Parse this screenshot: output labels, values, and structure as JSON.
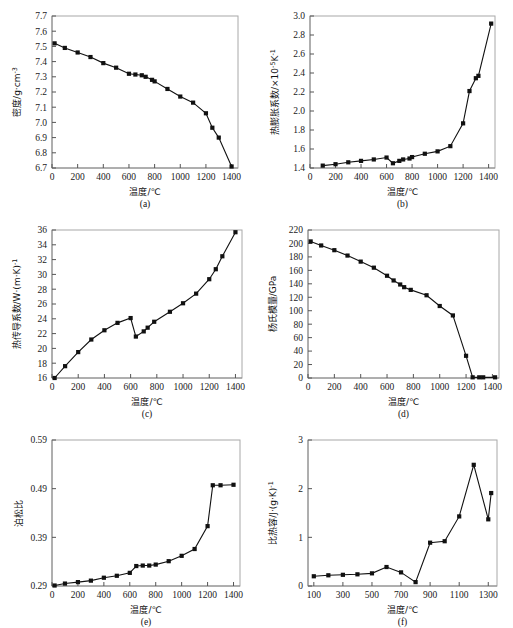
{
  "figure": {
    "xlabel": "温度/℃",
    "panels": [
      "(a)",
      "(b)",
      "(c)",
      "(d)",
      "(e)",
      "(f)"
    ]
  },
  "chart_data": [
    {
      "type": "line",
      "panel": "(a)",
      "title": "",
      "xlabel": "温度/℃",
      "ylabel": "密度/g·cm⁻³",
      "ylabel_base": "密度/g·cm",
      "ylabel_sup": "-3",
      "xlim": [
        0,
        1450
      ],
      "ylim": [
        6.7,
        7.7
      ],
      "xticks": [
        0,
        200,
        400,
        600,
        800,
        1000,
        1200,
        1400
      ],
      "yticks": [
        6.7,
        6.8,
        6.9,
        7.0,
        7.1,
        7.2,
        7.3,
        7.4,
        7.5,
        7.6,
        7.7
      ],
      "grid": false,
      "legend": "none",
      "x": [
        20,
        100,
        200,
        300,
        400,
        500,
        600,
        650,
        700,
        730,
        780,
        800,
        900,
        1000,
        1100,
        1200,
        1250,
        1300,
        1400
      ],
      "y": [
        7.52,
        7.49,
        7.46,
        7.43,
        7.39,
        7.36,
        7.32,
        7.315,
        7.31,
        7.3,
        7.28,
        7.27,
        7.22,
        7.17,
        7.13,
        7.06,
        6.965,
        6.9,
        6.71
      ]
    },
    {
      "type": "line",
      "panel": "(b)",
      "title": "",
      "xlabel": "温度/℃",
      "ylabel": "热膨胀系数/×10⁻⁵K⁻¹",
      "ylabel_base": "热膨胀系数/×10",
      "ylabel_sup": "-5",
      "ylabel_tail": "K",
      "xlim": [
        0,
        1450
      ],
      "ylim": [
        1.4,
        3.0
      ],
      "xticks": [
        0,
        200,
        400,
        600,
        800,
        1000,
        1200,
        1400
      ],
      "yticks": [
        1.4,
        1.6,
        1.8,
        2.0,
        2.2,
        2.4,
        2.6,
        2.8,
        3.0
      ],
      "grid": false,
      "legend": "none",
      "x": [
        100,
        200,
        300,
        400,
        500,
        600,
        650,
        700,
        730,
        780,
        800,
        900,
        1000,
        1100,
        1200,
        1250,
        1300,
        1320,
        1420
      ],
      "y": [
        1.425,
        1.44,
        1.46,
        1.475,
        1.49,
        1.51,
        1.45,
        1.475,
        1.49,
        1.5,
        1.515,
        1.55,
        1.575,
        1.63,
        1.87,
        2.21,
        2.345,
        2.37,
        2.92
      ]
    },
    {
      "type": "line",
      "panel": "(c)",
      "title": "",
      "xlabel": "温度/℃",
      "ylabel": "热传导系数/W·(m·K)⁻¹",
      "ylabel_base": "热传导系数/W·(m·K)",
      "ylabel_sup": "-1",
      "xlim": [
        0,
        1450
      ],
      "ylim": [
        16,
        36
      ],
      "xticks": [
        0,
        200,
        400,
        600,
        800,
        1000,
        1200,
        1400
      ],
      "yticks": [
        16,
        18,
        20,
        22,
        24,
        26,
        28,
        30,
        32,
        34,
        36
      ],
      "grid": false,
      "legend": "none",
      "x": [
        20,
        100,
        200,
        300,
        400,
        500,
        600,
        640,
        700,
        730,
        780,
        900,
        1000,
        1100,
        1200,
        1250,
        1300,
        1400
      ],
      "y": [
        16.0,
        17.6,
        19.5,
        21.2,
        22.45,
        23.45,
        24.1,
        21.6,
        22.3,
        22.8,
        23.6,
        24.95,
        26.1,
        27.4,
        29.35,
        30.7,
        32.45,
        35.7
      ]
    },
    {
      "type": "line",
      "panel": "(d)",
      "title": "",
      "xlabel": "温度/℃",
      "ylabel": "杨氏模量/GPa",
      "ylabel_base": "杨氏模量/GPa",
      "xlim": [
        0,
        1450
      ],
      "ylim": [
        0,
        220
      ],
      "xticks": [
        0,
        200,
        400,
        600,
        800,
        1000,
        1200,
        1400
      ],
      "yticks": [
        0,
        20,
        40,
        60,
        80,
        100,
        120,
        140,
        160,
        180,
        200,
        220
      ],
      "grid": false,
      "legend": "none",
      "x": [
        20,
        100,
        200,
        300,
        400,
        500,
        600,
        650,
        700,
        730,
        780,
        900,
        1000,
        1100,
        1200,
        1250,
        1300,
        1330,
        1420
      ],
      "y": [
        203,
        197,
        190,
        182,
        173,
        164,
        152,
        145,
        139,
        135,
        131,
        123,
        107,
        93,
        33,
        1,
        1,
        1,
        1
      ]
    },
    {
      "type": "line",
      "panel": "(e)",
      "title": "",
      "xlabel": "温度/℃",
      "ylabel": "泊松比",
      "ylabel_base": "泊松比",
      "xlim": [
        0,
        1450
      ],
      "ylim": [
        0.29,
        0.59
      ],
      "xticks": [
        0,
        200,
        400,
        600,
        800,
        1000,
        1200,
        1400
      ],
      "yticks": [
        0.29,
        0.39,
        0.49,
        0.59
      ],
      "grid": false,
      "legend": "none",
      "x": [
        20,
        100,
        200,
        300,
        400,
        500,
        600,
        650,
        700,
        750,
        800,
        900,
        1000,
        1100,
        1200,
        1240,
        1300,
        1400
      ],
      "y": [
        0.291,
        0.295,
        0.298,
        0.301,
        0.307,
        0.311,
        0.317,
        0.331,
        0.332,
        0.332,
        0.334,
        0.341,
        0.352,
        0.366,
        0.413,
        0.497,
        0.497,
        0.498
      ]
    },
    {
      "type": "line",
      "panel": "(f)",
      "title": "",
      "xlabel": "温度/℃",
      "ylabel": "比热容/J·(g·K)⁻¹",
      "ylabel_base": "比热容/J·(g·K)",
      "ylabel_sup": "-1",
      "xlim": [
        60,
        1360
      ],
      "ylim": [
        0,
        3.0
      ],
      "xticks": [
        100,
        300,
        500,
        700,
        900,
        1100,
        1300
      ],
      "yticks": [
        0,
        1.0,
        2.0,
        3.0
      ],
      "grid": false,
      "legend": "none",
      "x": [
        100,
        200,
        300,
        400,
        500,
        600,
        700,
        800,
        900,
        1000,
        1100,
        1200,
        1300,
        1320
      ],
      "y": [
        0.2,
        0.22,
        0.23,
        0.24,
        0.26,
        0.39,
        0.28,
        0.08,
        0.89,
        0.92,
        1.43,
        2.49,
        1.37,
        1.91
      ]
    }
  ]
}
